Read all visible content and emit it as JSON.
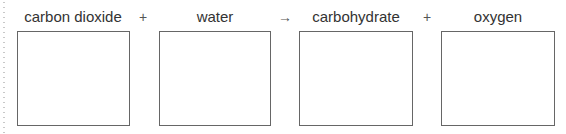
{
  "equation": {
    "terms": [
      {
        "label": "carbon dioxide",
        "box_value": ""
      },
      {
        "label": "water",
        "box_value": ""
      },
      {
        "label": "carbohydrate",
        "box_value": ""
      },
      {
        "label": "oxygen",
        "box_value": ""
      }
    ],
    "operators": [
      "+",
      "→",
      "+"
    ]
  },
  "colors": {
    "box_border": "#666666",
    "text": "#333333"
  }
}
